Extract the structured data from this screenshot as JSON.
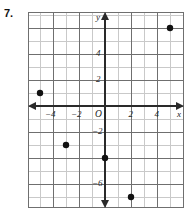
{
  "problem": {
    "number": "7."
  },
  "chart_data": {
    "type": "scatter",
    "title": "",
    "xlabel": "x",
    "ylabel": "y",
    "xlim": [
      -6,
      6
    ],
    "ylim": [
      -8,
      7
    ],
    "grid": true,
    "legend": "none",
    "x_tick_labels": [
      "-4",
      "-2",
      "2",
      "4"
    ],
    "x_tick_values": [
      -4,
      -2,
      2,
      4
    ],
    "y_tick_labels": [
      "4",
      "2",
      "-2",
      "-6"
    ],
    "y_tick_values": [
      4,
      2,
      -2,
      -6
    ],
    "origin_label": "O",
    "points": [
      {
        "x": -5,
        "y": 1
      },
      {
        "x": -3,
        "y": -3
      },
      {
        "x": 0,
        "y": -4
      },
      {
        "x": 2,
        "y": -7
      },
      {
        "x": 5,
        "y": 6
      }
    ],
    "point_color": "#111111",
    "axis_color": "#2a2a2a",
    "major_grid_color": "#6f6f6f",
    "minor_grid_color": "#c9c9c9"
  }
}
